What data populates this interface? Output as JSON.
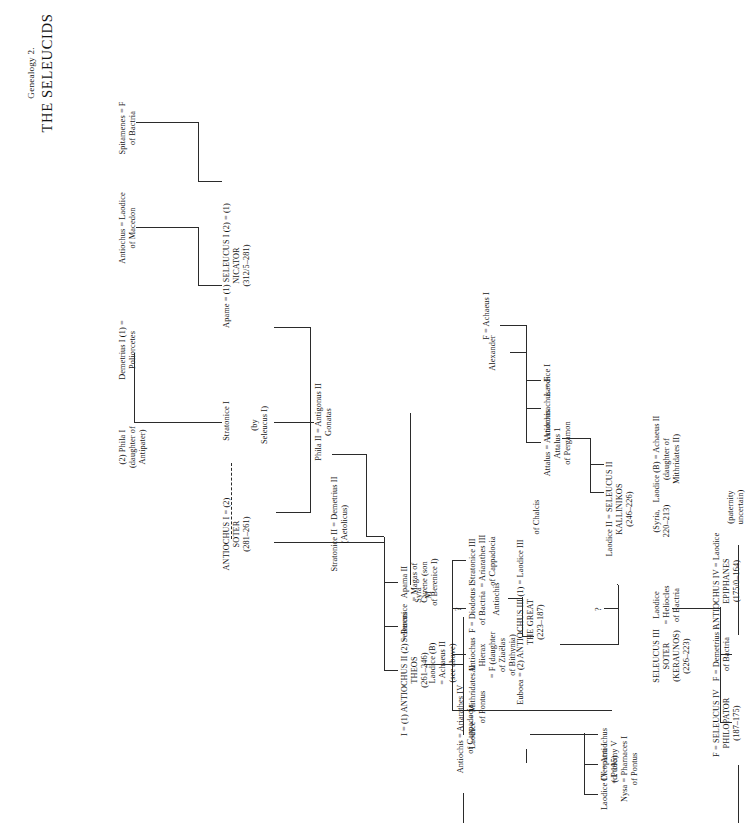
{
  "page": {
    "genealogy_number": "Genealogy 2.",
    "title": "THE SELEUCIDS"
  },
  "nodes": {
    "spitamenes": "Spitamenes = F",
    "spitamenes_sub": "of Bactria",
    "antiochus_macedon": "Antiochus  =  Laodice",
    "antiochus_macedon_sub": "of Macedon",
    "demetrius_i": "Demetrius I (1)  =",
    "demetrius_i_sub": "Poliorcetes",
    "phila_i": "(2) Phila I",
    "phila_i_sub": "(daughter of",
    "phila_i_sub2": "Antipater)",
    "apame": "Apame  =  (1) SELEUCUS I (2)  =  (1)",
    "seleucus_i_sub1": "NICATOR",
    "seleucus_i_sub2": "(312/5–281)",
    "stratonice_i": "Stratonice I",
    "by_seleucus": "(by",
    "by_seleucus2": "Seleucus I)",
    "phila_ii": "Phila II  =  Antigonus II",
    "phila_ii_sub": "Gonatas",
    "antiochus_i": "ANTIOCHUS I  =  (2)",
    "antiochus_i_sub1": "SOTER",
    "antiochus_i_sub2": "(281–261)",
    "stratonice_ii": "Stratonice II  =  Demetrius II",
    "stratonice_ii_sub": "(Aetolicus)",
    "apama_ii": "Apama II",
    "apama_ii_sub1": "= Magas of",
    "apama_ii_sub2": "Cyrene (son",
    "apama_ii_sub3": "of Berenice I)",
    "seleucus_son": "Seleucus",
    "antiochus_ii": "I  =  (1) ANTIOCHUS II (2)  =  Berenice",
    "antiochus_ii_sub1": "THEOS",
    "antiochus_ii_sub2": "(261–246)",
    "berenice_syra": "Syra",
    "berenice_m": "M",
    "alexander": "Alexander",
    "f_achaeus": "F  =  Achaeus I",
    "laodice_i": "Laodice I",
    "stratonice_iii": "Stratonice III",
    "stratonice_iii_sub1": "= Ariarathes III",
    "stratonice_iii_sub2": "of Cappadocia",
    "f_diodotus": "F = Diodotus I",
    "f_diodotus_sub": "of Bactria",
    "antiochus_hierax": "Antiochus",
    "antiochus_hierax_sub1": "Hierax",
    "antiochus_hierax_sub2": "= F (daughter",
    "antiochus_hierax_sub3": "of Ziaëlas",
    "antiochus_hierax_sub4": "of Bithynia)",
    "laodice_mithridates": "Laodice  =  Mithridates II",
    "laodice_mithridates_sub": "of Pontus",
    "attalus": "Attalus  =  Antiochis",
    "attalus_sub1": "Attalus 1",
    "attalus_sub2": "of Pergamon",
    "andromachus": "Andromachus  =  F",
    "laodice_ii": "Laodice II  =  SELEUCUS II",
    "seleucus_ii_sub1": "KALLINIKOS",
    "seleucus_ii_sub2": "(246–226)",
    "antiochis_small": "Antiochis",
    "antiochus_iii": "Euboea  =  (2) ANTIOCHUS III (1)  =  Laodice III",
    "antiochus_iii_sub0": "of Chalcis",
    "antiochus_iii_sub1": "THE GREAT",
    "antiochus_iii_sub2": "(223–187)",
    "laodice_b": "Laodice (B)   =  Achaeus II",
    "laodice_b_sub1": "(daughter of",
    "laodice_b_sub2": "Mithridates II)",
    "achaeus_ii_sub1": "(Syria,",
    "achaeus_ii_sub2": "220–213)",
    "laodice_heliocles": "Laodice",
    "laodice_heliocles_sub1": "= Heliocles",
    "laodice_heliocles_sub2": "of Bactria",
    "euboea_chalcis": "Euboea",
    "euboea_chalcis_sub": "of Chalcis",
    "seleucus_iii": "SELEUCUS III",
    "seleucus_iii_sub1": "SOTER",
    "seleucus_iii_sub2": "(KERAUNOS)",
    "seleucus_iii_sub3": "(226–223)",
    "laodice_iv": "Laodice IV  =  Antiochus",
    "laodice_iv_sub1": "(d. 195)",
    "laodice_iv_sub2": "Nysa = Pharnaces I",
    "laodice_iv_sub3": "of Pontus",
    "cleopatra_i": "Cleopatra I",
    "cleopatra_i_sub": "= Ptolemy V",
    "antiochis_cappadocia": "Antiochis  =  Ariarathes IV",
    "antiochis_cappadocia_sub": "of Cappadocia",
    "laodice_b2": "Laodice (B)",
    "laodice_b2_sub1": "= Achaeus II",
    "laodice_b2_sub2": "(see above)",
    "antiochus_iv": "ANTIOCHUS IV  =  Laodice",
    "antiochus_iv_sub1": "EPIPHANES",
    "antiochus_iv_sub2": "(175/0–164)",
    "antiochus_iv_wife1": "(paternity",
    "antiochus_iv_wife2": "uncertain)",
    "f_demetrius_bactria": "F = Demetrius I",
    "f_demetrius_bactria_sub": "of Bactria",
    "seleucus_iv": "F  =  SELEUCUS IV",
    "seleucus_iv_sub1": "PHILOPATOR",
    "seleucus_iv_sub2": "(187–175)",
    "qmark": "?"
  }
}
